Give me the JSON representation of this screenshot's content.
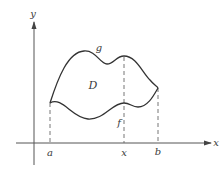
{
  "diagram": {
    "type": "region-between-curves",
    "axes": {
      "x_label": "x",
      "y_label": "y"
    },
    "curves": {
      "upper": {
        "label": "g"
      },
      "lower": {
        "label": "f"
      }
    },
    "region": {
      "label": "D"
    },
    "x_markers": [
      {
        "label": "a"
      },
      {
        "label": "x"
      },
      {
        "label": "b"
      }
    ],
    "colors": {
      "stroke": "#333333",
      "axis": "#555555",
      "dashed": "#666666",
      "text": "#3a3a3a",
      "background": "#ffffff"
    }
  }
}
